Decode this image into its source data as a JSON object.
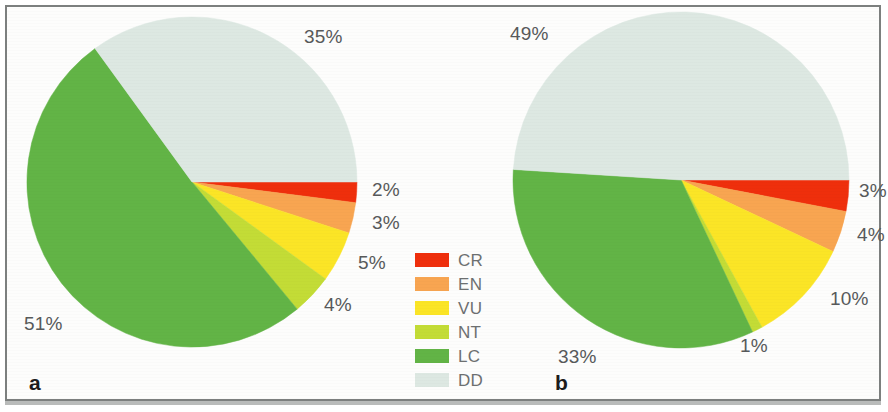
{
  "figure": {
    "background": "#ffffff",
    "frame_color": "#7c7f7e",
    "label_color": "#57595a"
  },
  "legend": {
    "items": [
      {
        "code": "CR",
        "color": "#ef2f0c"
      },
      {
        "code": "EN",
        "color": "#f7a košice"
      }
    ]
  },
  "chart_data": [
    {
      "type": "pie",
      "panel": "a",
      "title": "",
      "categories": [
        "CR",
        "EN",
        "VU",
        "NT",
        "LC",
        "DD"
      ],
      "values": [
        2,
        3,
        5,
        4,
        51,
        35
      ],
      "labels": [
        "2%",
        "3%",
        "5%",
        "4%",
        "51%",
        "35%"
      ],
      "colors": [
        "#ef2f0c",
        "#f8a551",
        "#fbe залог"
      ],
      "start_angle_deg": 0,
      "direction": "clockwise",
      "legend_position": "right"
    }
  ]
}
